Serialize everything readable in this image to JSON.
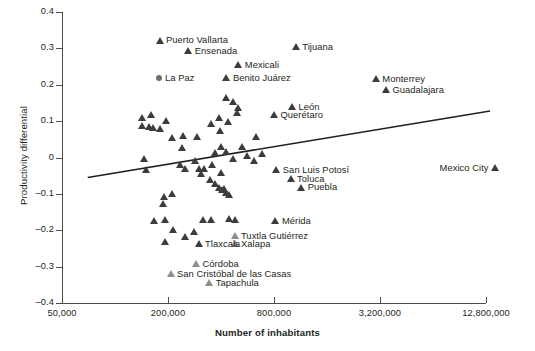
{
  "chart_data": {
    "type": "scatter",
    "title": "",
    "xlabel": "Number of inhabitants",
    "ylabel": "Productivity differential",
    "x_scale": "log4",
    "x_ticks": [
      "50,000",
      "200,000",
      "800,000",
      "3,200,000",
      "12,800,000"
    ],
    "x_tick_values": [
      50000,
      200000,
      800000,
      3200000,
      12800000
    ],
    "y_ticks": [
      "0.4",
      "0.3",
      "0.2",
      "0.1",
      "0",
      "-0.1",
      "-0.2",
      "-0.3",
      "-0.4"
    ],
    "y_tick_values": [
      0.4,
      0.3,
      0.2,
      0.1,
      0,
      -0.1,
      -0.2,
      -0.3,
      -0.4
    ],
    "ylim": [
      -0.4,
      0.4
    ],
    "grid": false,
    "legend": "none",
    "marker_color": "#3c3c3c",
    "marker_color_light": "#8e8e8e",
    "trendline": {
      "type": "linear",
      "x_start": 70000,
      "y_start": -0.055,
      "x_end": 13500000,
      "y_end": 0.128
    },
    "labeled_points": [
      {
        "name": "Puerto Vallarta",
        "x": 180000,
        "y": 0.322,
        "label_side": "right",
        "marker": "triangle"
      },
      {
        "name": "Ensenada",
        "x": 262000,
        "y": 0.293,
        "label_side": "right",
        "marker": "triangle"
      },
      {
        "name": "Tijuana",
        "x": 1070000,
        "y": 0.305,
        "label_side": "right",
        "marker": "triangle"
      },
      {
        "name": "Mexicali",
        "x": 505000,
        "y": 0.255,
        "label_side": "right",
        "marker": "triangle"
      },
      {
        "name": "La Paz",
        "x": 178000,
        "y": 0.218,
        "label_side": "right",
        "marker": "circle"
      },
      {
        "name": "Benito Juárez",
        "x": 432000,
        "y": 0.218,
        "label_side": "right",
        "marker": "triangle"
      },
      {
        "name": "Monterrey",
        "x": 3050000,
        "y": 0.215,
        "label_side": "right",
        "marker": "triangle"
      },
      {
        "name": "Guadalajara",
        "x": 3480000,
        "y": 0.185,
        "label_side": "right",
        "marker": "triangle"
      },
      {
        "name": "León",
        "x": 1020000,
        "y": 0.14,
        "label_side": "right",
        "marker": "triangle"
      },
      {
        "name": "Querétaro",
        "x": 805000,
        "y": 0.118,
        "label_side": "right",
        "marker": "triangle"
      },
      {
        "name": "San Luis Potosí",
        "x": 830000,
        "y": -0.035,
        "label_side": "right",
        "marker": "triangle"
      },
      {
        "name": "Mexico City",
        "x": 14500000,
        "y": -0.028,
        "label_side": "left",
        "marker": "triangle"
      },
      {
        "name": "Toluca",
        "x": 1000000,
        "y": -0.058,
        "label_side": "right",
        "marker": "triangle"
      },
      {
        "name": "Puebla",
        "x": 1150000,
        "y": -0.082,
        "label_side": "right",
        "marker": "triangle"
      },
      {
        "name": "Mérida",
        "x": 820000,
        "y": -0.175,
        "label_side": "right",
        "marker": "triangle"
      },
      {
        "name": "Tuxtla Gutiérrez",
        "x": 480000,
        "y": -0.215,
        "label_side": "right",
        "marker": "triangle-light"
      },
      {
        "name": "Xalapa",
        "x": 480000,
        "y": -0.238,
        "label_side": "right",
        "marker": "triangle-light"
      },
      {
        "name": "Tlaxcala",
        "x": 300000,
        "y": -0.238,
        "label_side": "right",
        "marker": "triangle"
      },
      {
        "name": "Córdoba",
        "x": 290000,
        "y": -0.292,
        "label_side": "right",
        "marker": "triangle-light"
      },
      {
        "name": "San Cristóbal de las Casas",
        "x": 208000,
        "y": -0.32,
        "label_side": "right",
        "marker": "triangle-light"
      },
      {
        "name": "Tapachula",
        "x": 345000,
        "y": -0.345,
        "label_side": "right",
        "marker": "triangle-light"
      }
    ],
    "unlabeled_points": [
      {
        "x": 143000,
        "y": 0.108
      },
      {
        "x": 160000,
        "y": 0.117
      },
      {
        "x": 143000,
        "y": 0.088
      },
      {
        "x": 156000,
        "y": 0.085
      },
      {
        "x": 166000,
        "y": 0.082
      },
      {
        "x": 182000,
        "y": 0.08
      },
      {
        "x": 196000,
        "y": 0.1
      },
      {
        "x": 213000,
        "y": 0.055
      },
      {
        "x": 246000,
        "y": 0.06
      },
      {
        "x": 240000,
        "y": 0.026
      },
      {
        "x": 292000,
        "y": 0.056
      },
      {
        "x": 354000,
        "y": 0.092
      },
      {
        "x": 394000,
        "y": 0.108
      },
      {
        "x": 398000,
        "y": 0.074
      },
      {
        "x": 443000,
        "y": 0.098
      },
      {
        "x": 432000,
        "y": 0.165
      },
      {
        "x": 468000,
        "y": 0.152
      },
      {
        "x": 500000,
        "y": 0.138
      },
      {
        "x": 496000,
        "y": 0.122
      },
      {
        "x": 635000,
        "y": 0.057
      },
      {
        "x": 147000,
        "y": -0.003
      },
      {
        "x": 150000,
        "y": -0.035
      },
      {
        "x": 236000,
        "y": -0.02
      },
      {
        "x": 252000,
        "y": -0.032
      },
      {
        "x": 286000,
        "y": -0.01
      },
      {
        "x": 300000,
        "y": -0.03
      },
      {
        "x": 310000,
        "y": -0.046
      },
      {
        "x": 322000,
        "y": -0.03
      },
      {
        "x": 356000,
        "y": -0.02
      },
      {
        "x": 374000,
        "y": 0.012
      },
      {
        "x": 402000,
        "y": 0.03
      },
      {
        "x": 432000,
        "y": 0.015
      },
      {
        "x": 470000,
        "y": -0.004
      },
      {
        "x": 530000,
        "y": 0.03
      },
      {
        "x": 566000,
        "y": 0.006
      },
      {
        "x": 620000,
        "y": -0.01
      },
      {
        "x": 690000,
        "y": 0.01
      },
      {
        "x": 192000,
        "y": -0.108
      },
      {
        "x": 212000,
        "y": -0.1
      },
      {
        "x": 188000,
        "y": -0.128
      },
      {
        "x": 350000,
        "y": -0.06
      },
      {
        "x": 372000,
        "y": -0.073
      },
      {
        "x": 392000,
        "y": -0.082
      },
      {
        "x": 406000,
        "y": -0.09
      },
      {
        "x": 418000,
        "y": -0.086
      },
      {
        "x": 432000,
        "y": -0.096
      },
      {
        "x": 448000,
        "y": -0.103
      },
      {
        "x": 400000,
        "y": -0.042
      },
      {
        "x": 168000,
        "y": -0.175
      },
      {
        "x": 194000,
        "y": -0.172
      },
      {
        "x": 318000,
        "y": -0.17
      },
      {
        "x": 354000,
        "y": -0.172
      },
      {
        "x": 446000,
        "y": -0.168
      },
      {
        "x": 480000,
        "y": -0.172
      },
      {
        "x": 215000,
        "y": -0.2
      },
      {
        "x": 282000,
        "y": -0.205
      },
      {
        "x": 193000,
        "y": -0.232
      },
      {
        "x": 250000,
        "y": -0.218
      }
    ]
  },
  "axes": {
    "x_title": "Number of inhabitants",
    "y_title": "Productivity differential"
  }
}
